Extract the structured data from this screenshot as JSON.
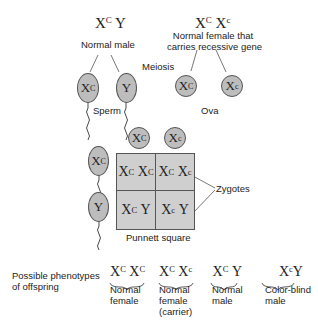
{
  "parents": {
    "male": {
      "genotype_base1": "X",
      "genotype_sup1": "C",
      "genotype_base2": "Y",
      "label": "Normal male"
    },
    "female": {
      "genotype_base1": "X",
      "genotype_sup1": "C",
      "genotype_base2": "X",
      "genotype_sup2": "c",
      "label_line1": "Normal female that",
      "label_line2": "carries recessive gene"
    }
  },
  "process_label": "Meiosis",
  "sperm": {
    "label": "Sperm",
    "cells": [
      {
        "base": "X",
        "sup": "C"
      },
      {
        "base": "Y",
        "sup": ""
      }
    ]
  },
  "ova": {
    "label": "Ova",
    "cells": [
      {
        "base": "X",
        "sup": "C"
      },
      {
        "base": "X",
        "sup": "c"
      }
    ]
  },
  "punnett": {
    "label": "Punnett square",
    "zygotes_label": "Zygotes",
    "top": [
      {
        "base": "X",
        "sup": "C"
      },
      {
        "base": "X",
        "sup": "c"
      }
    ],
    "left": [
      {
        "base": "X",
        "sup": "C"
      },
      {
        "base": "Y",
        "sup": ""
      }
    ],
    "cells": [
      {
        "b1": "X",
        "s1": "C",
        "b2": "X",
        "s2": "C"
      },
      {
        "b1": "X",
        "s1": "C",
        "b2": "X",
        "s2": "c"
      },
      {
        "b1": "X",
        "s1": "C",
        "b2": "Y",
        "s2": ""
      },
      {
        "b1": "X",
        "s1": "c",
        "b2": "Y",
        "s2": ""
      }
    ]
  },
  "phenotypes": {
    "title_line1": "Possible phenotypes",
    "title_line2": "of offspring",
    "items": [
      {
        "b1": "X",
        "s1": "C",
        "b2": "X",
        "s2": "C",
        "line1": "Normal",
        "line2": "female",
        "line3": ""
      },
      {
        "b1": "X",
        "s1": "C",
        "b2": "X",
        "s2": "c",
        "line1": "Normal",
        "line2": "female",
        "line3": "(carrier)"
      },
      {
        "b1": "X",
        "s1": "C",
        "b2": "Y",
        "s2": "",
        "line1": "Normal",
        "line2": "male",
        "line3": ""
      },
      {
        "b1": "X",
        "s1": "c",
        "b2": "Y",
        "s2": "",
        "line1": "Color-blind",
        "line2": "male",
        "line3": ""
      }
    ]
  },
  "colors": {
    "cell_fill": "#cfcfcf",
    "gamete_fill": "#bdbdbd",
    "line": "#444444"
  }
}
